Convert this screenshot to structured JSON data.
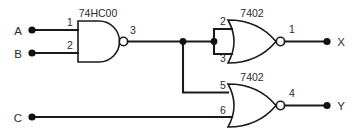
{
  "diagram": {
    "background_color": "#ffffff",
    "line_color": "#1a1a1a"
  },
  "inputs": [
    {
      "label": "A",
      "pin": "1"
    },
    {
      "label": "B",
      "pin": "2"
    },
    {
      "label": "C",
      "pin": "6"
    }
  ],
  "outputs": [
    {
      "label": "X",
      "pin": "1"
    },
    {
      "label": "Y",
      "pin": "4"
    }
  ],
  "gates": [
    {
      "id": "nand1",
      "type": "NAND",
      "chip": "74HC00",
      "input_pins": [
        "1",
        "2"
      ],
      "output_pin": "3"
    },
    {
      "id": "nor1",
      "type": "NOR",
      "chip": "7402",
      "input_pins": [
        "2",
        "3"
      ],
      "output_pin": "1"
    },
    {
      "id": "nor2",
      "type": "NOR",
      "chip": "7402",
      "input_pins": [
        "5",
        "6"
      ],
      "output_pin": "4"
    }
  ],
  "pin_numbers": {
    "nand_in_a": "1",
    "nand_in_b": "2",
    "nand_out": "3",
    "nor1_in_top": "2",
    "nor1_in_bottom": "3",
    "nor1_out": "1",
    "nor2_in_top": "5",
    "nor2_in_bottom": "6",
    "nor2_out": "4"
  },
  "chip_labels": {
    "nand": "74HC00",
    "nor_top": "7402",
    "nor_bottom": "7402"
  },
  "io_labels": {
    "in_a": "A",
    "in_b": "B",
    "in_c": "C",
    "out_x": "X",
    "out_y": "Y"
  }
}
